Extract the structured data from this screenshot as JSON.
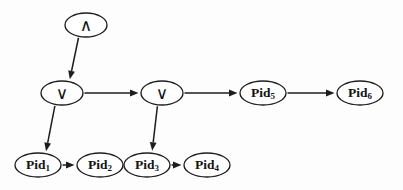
{
  "diagram": {
    "background_color": "#fdfdfd",
    "stroke_color": "#1d1d1d",
    "nodes": [
      {
        "id": "and1",
        "label": "∧",
        "sub": "",
        "kind": "operator",
        "cx": 86,
        "cy": 25,
        "rx": 21,
        "ry": 12
      },
      {
        "id": "or1",
        "label": "∨",
        "sub": "",
        "kind": "operator",
        "cx": 62,
        "cy": 93,
        "rx": 21,
        "ry": 12
      },
      {
        "id": "or2",
        "label": "∨",
        "sub": "",
        "kind": "operator",
        "cx": 162,
        "cy": 93,
        "rx": 21,
        "ry": 12
      },
      {
        "id": "pid5",
        "label": "Pid",
        "sub": "5",
        "kind": "process",
        "cx": 263,
        "cy": 93,
        "rx": 23,
        "ry": 12
      },
      {
        "id": "pid6",
        "label": "Pid",
        "sub": "6",
        "kind": "process",
        "cx": 360,
        "cy": 93,
        "rx": 23,
        "ry": 12
      },
      {
        "id": "pid1",
        "label": "Pid",
        "sub": "1",
        "kind": "process",
        "cx": 38,
        "cy": 165,
        "rx": 23,
        "ry": 12
      },
      {
        "id": "pid2",
        "label": "Pid",
        "sub": "2",
        "kind": "process",
        "cx": 100,
        "cy": 165,
        "rx": 23,
        "ry": 12
      },
      {
        "id": "pid3",
        "label": "Pid",
        "sub": "3",
        "kind": "process",
        "cx": 147,
        "cy": 165,
        "rx": 23,
        "ry": 12
      },
      {
        "id": "pid4",
        "label": "Pid",
        "sub": "4",
        "kind": "process",
        "cx": 207,
        "cy": 165,
        "rx": 23,
        "ry": 12
      }
    ],
    "edges": [
      {
        "id": "e-and1-or1",
        "from": "and1",
        "to": "or1",
        "style": "diagonal"
      },
      {
        "id": "e-or1-or2",
        "from": "or1",
        "to": "or2",
        "style": "horizontal"
      },
      {
        "id": "e-or2-pid5",
        "from": "or2",
        "to": "pid5",
        "style": "horizontal"
      },
      {
        "id": "e-pid5-pid6",
        "from": "pid5",
        "to": "pid6",
        "style": "horizontal"
      },
      {
        "id": "e-or1-pid1",
        "from": "or1",
        "to": "pid1",
        "style": "diagonal"
      },
      {
        "id": "e-or2-pid3",
        "from": "or2",
        "to": "pid3",
        "style": "diagonal"
      },
      {
        "id": "e-pid1-pid2",
        "from": "pid1",
        "to": "pid2",
        "style": "horizontal"
      },
      {
        "id": "e-pid3-pid4",
        "from": "pid3",
        "to": "pid4",
        "style": "horizontal"
      }
    ]
  }
}
